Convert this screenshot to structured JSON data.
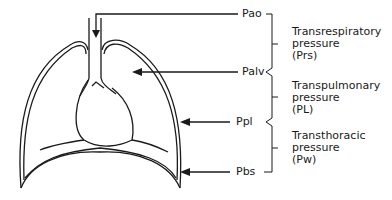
{
  "diagram": {
    "type": "respiratory-system-pressures",
    "pressure_points": [
      {
        "id": "pao",
        "label": "Pao",
        "y": 14
      },
      {
        "id": "palv",
        "label": "Palv",
        "y": 72
      },
      {
        "id": "ppl",
        "label": "Ppl",
        "y": 122
      },
      {
        "id": "pbs",
        "label": "Pbs",
        "y": 172
      }
    ],
    "pressure_groups": [
      {
        "id": "prs",
        "line1": "Transrespiratory",
        "line2": "pressure",
        "line3": "(Prs)"
      },
      {
        "id": "pl",
        "line1": "Transpulmonary",
        "line2": "pressure",
        "line3": "(PL)"
      },
      {
        "id": "pw",
        "line1": "Transthoracic",
        "line2": "pressure",
        "line3": "(Pw)"
      }
    ],
    "colors": {
      "line": "#1a1a1a",
      "background": "#ffffff"
    }
  }
}
